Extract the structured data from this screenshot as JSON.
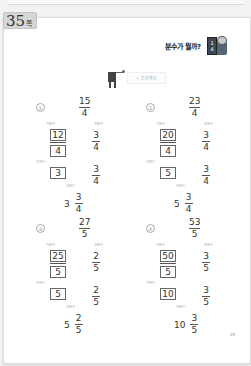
{
  "page_tag": {
    "number": "35",
    "suffix": "쪽"
  },
  "header": {
    "title": "분수가 뭘까?",
    "icon": "fraction-card-character-icon"
  },
  "section": {
    "label": "✎ 인공계산",
    "icon": "flag-icon"
  },
  "labels": {
    "improper": "가분수",
    "proper": "진분수",
    "natural": "자연수",
    "mixed": "대분수"
  },
  "problems": [
    {
      "index": "①",
      "improper": {
        "numerator": "15",
        "denominator": "4"
      },
      "boxed_numerator": "12",
      "boxed_denominator": "4",
      "proper": {
        "numerator": "3",
        "denominator": "4"
      },
      "natural": "3",
      "proper2": {
        "numerator": "3",
        "denominator": "4"
      },
      "result": {
        "whole": "3",
        "numerator": "3",
        "denominator": "4"
      }
    },
    {
      "index": "②",
      "improper": {
        "numerator": "23",
        "denominator": "4"
      },
      "boxed_numerator": "20",
      "boxed_denominator": "4",
      "proper": {
        "numerator": "3",
        "denominator": "4"
      },
      "natural": "5",
      "proper2": {
        "numerator": "3",
        "denominator": "4"
      },
      "result": {
        "whole": "5",
        "numerator": "3",
        "denominator": "4"
      }
    },
    {
      "index": "③",
      "improper": {
        "numerator": "27",
        "denominator": "5"
      },
      "boxed_numerator": "25",
      "boxed_denominator": "5",
      "proper": {
        "numerator": "2",
        "denominator": "5"
      },
      "natural": "5",
      "proper2": {
        "numerator": "2",
        "denominator": "5"
      },
      "result": {
        "whole": "5",
        "numerator": "2",
        "denominator": "5"
      }
    },
    {
      "index": "④",
      "improper": {
        "numerator": "53",
        "denominator": "5"
      },
      "boxed_numerator": "50",
      "boxed_denominator": "5",
      "proper": {
        "numerator": "3",
        "denominator": "5"
      },
      "natural": "10",
      "proper2": {
        "numerator": "3",
        "denominator": "5"
      },
      "result": {
        "whole": "10",
        "numerator": "3",
        "denominator": "5"
      }
    }
  ],
  "footer": {
    "page_number": "35"
  }
}
